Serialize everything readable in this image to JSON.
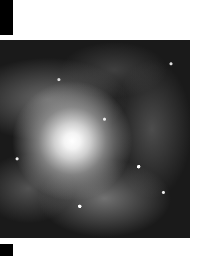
{
  "image": {
    "subject": "spiral galaxy",
    "style": "grayscale astronomical photograph"
  }
}
